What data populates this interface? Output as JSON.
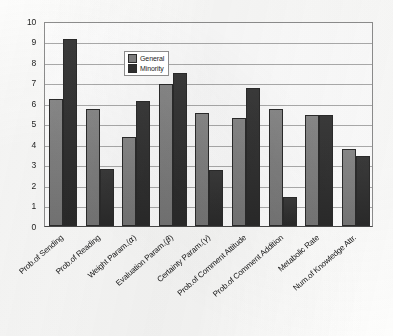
{
  "chart_data": {
    "type": "bar",
    "title": "",
    "subtitle": "",
    "xlabel": "",
    "ylabel": "",
    "ylim": [
      0,
      10
    ],
    "ytick_step": 1,
    "grid": true,
    "legend_position": "inside-top-center-left",
    "orientation": "vertical",
    "grouping": "grouped",
    "categories": [
      "Prob.of Sending",
      "Prob.of Reading",
      "Weight Param.(α)",
      "Evaluation Param.(β)",
      "Certainty Param.(γ)",
      "Prob.of Comment Attitude",
      "Prob.of Comment Addition",
      "Metabolic Rate",
      "Num.of Knowledge Attr."
    ],
    "category_parts": [
      {
        "text": "Prob.of Sending",
        "greek": ""
      },
      {
        "text": "Prob.of Reading",
        "greek": ""
      },
      {
        "pre": "Weight Param.(",
        "greek": "α",
        "post": ")"
      },
      {
        "pre": "Evaluation Param.(",
        "greek": "β",
        "post": ")"
      },
      {
        "pre": "Certainty Param.(",
        "greek": "γ",
        "post": ")"
      },
      {
        "text": "Prob.of Comment Attitude",
        "greek": ""
      },
      {
        "text": "Prob.of Comment Addition",
        "greek": ""
      },
      {
        "text": "Metabolic Rate",
        "greek": ""
      },
      {
        "text": "Num.of Knowledge Attr.",
        "greek": ""
      }
    ],
    "yticks": [
      10,
      9,
      8,
      7,
      6,
      5,
      4,
      3,
      2,
      1,
      0
    ],
    "series": [
      {
        "name": "General",
        "color": "#7d7d7d",
        "values": [
          6.2,
          5.7,
          4.35,
          6.95,
          5.5,
          5.25,
          5.7,
          5.4,
          3.75
        ]
      },
      {
        "name": "Minority",
        "color": "#2f2f2f",
        "values": [
          9.1,
          2.8,
          6.1,
          7.45,
          2.75,
          6.75,
          1.4,
          5.42,
          3.4
        ]
      }
    ]
  },
  "legend": {
    "entries": [
      {
        "label": "General",
        "swatch": "general-swatch"
      },
      {
        "label": "Minority",
        "swatch": "minority-swatch"
      }
    ]
  },
  "colors": {
    "general": "#7d7d7d",
    "minority": "#2f2f2f",
    "gridline": "#adadad",
    "axis": "#4a4a4a",
    "background": "#ffffff"
  }
}
